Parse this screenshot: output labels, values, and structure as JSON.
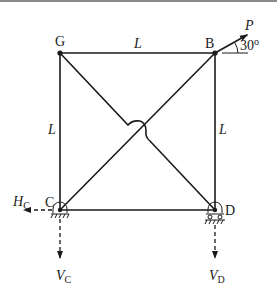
{
  "diagram": {
    "type": "plane truss",
    "nodes": [
      {
        "id": "G",
        "label": "G",
        "x": 60,
        "y": 53
      },
      {
        "id": "B",
        "label": "B",
        "x": 215,
        "y": 53
      },
      {
        "id": "C",
        "label": "C",
        "x": 60,
        "y": 210
      },
      {
        "id": "D",
        "label": "D",
        "x": 215,
        "y": 210
      }
    ],
    "members": [
      {
        "from": "G",
        "to": "B",
        "label": "L"
      },
      {
        "from": "G",
        "to": "C",
        "label": "L"
      },
      {
        "from": "B",
        "to": "D",
        "label": "L"
      },
      {
        "from": "C",
        "to": "D",
        "label": ""
      },
      {
        "from": "C",
        "to": "B",
        "label": ""
      },
      {
        "from": "G",
        "to": "D",
        "label": "",
        "note": "crosses CB without connection (hop)"
      }
    ],
    "member_labels": {
      "top": "L",
      "left": "L",
      "right": "L"
    },
    "load": {
      "name": "P",
      "at": "B",
      "angle_label": "30",
      "angle_unit": "o"
    },
    "supports": {
      "C": {
        "type": "pin",
        "reactions": [
          "H",
          "V"
        ]
      },
      "D": {
        "type": "roller",
        "reactions": [
          "V"
        ]
      }
    },
    "reactions": {
      "HC": {
        "main": "H",
        "sub": "C"
      },
      "VC": {
        "main": "V",
        "sub": "C"
      },
      "VD": {
        "main": "V",
        "sub": "D"
      }
    },
    "colors": {
      "ink": "#1a1a1a",
      "border": "#8a8a8a",
      "background": "#ffffff"
    }
  }
}
